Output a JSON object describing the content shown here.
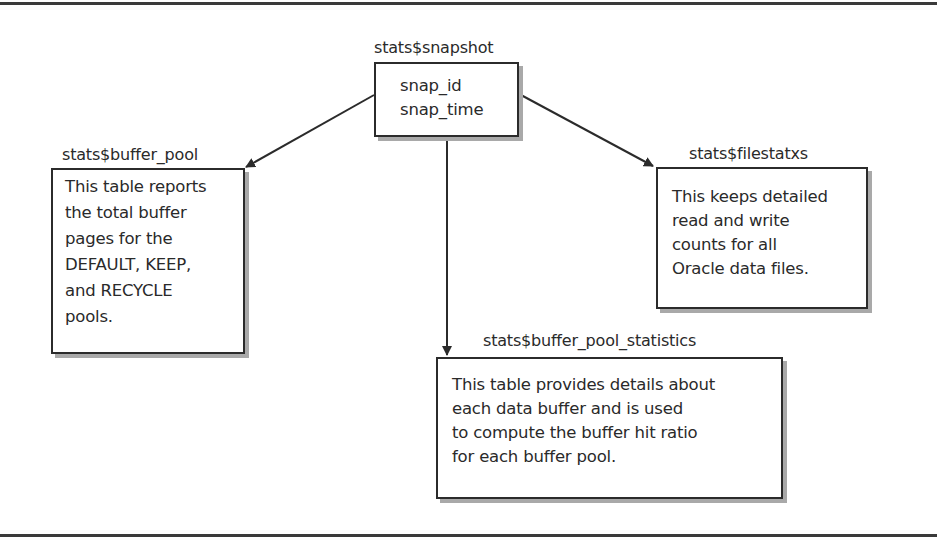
{
  "diagram": {
    "type": "entity-relationship",
    "frame": {
      "top_rule": true,
      "bottom_rule": true
    },
    "nodes": {
      "snapshot": {
        "title": "stats$snapshot",
        "lines": [
          "snap_id",
          "snap_time"
        ]
      },
      "buffer_pool": {
        "title": "stats$buffer_pool",
        "lines": [
          "This table reports",
          "the total buffer",
          "pages for the",
          "DEFAULT, KEEP,",
          "and RECYCLE",
          "pools."
        ]
      },
      "filestatxs": {
        "title": "stats$filestatxs",
        "lines": [
          "This keeps detailed",
          "read and write",
          "counts for all",
          "Oracle data files."
        ]
      },
      "buffer_pool_statistics": {
        "title": "stats$buffer_pool_statistics",
        "lines": [
          "This table provides details about",
          "each data buffer and is used",
          "to compute the buffer hit ratio",
          "for each buffer pool."
        ]
      }
    },
    "edges": [
      {
        "from": "stats$snapshot",
        "to": "stats$buffer_pool"
      },
      {
        "from": "stats$snapshot",
        "to": "stats$filestatxs"
      },
      {
        "from": "stats$snapshot",
        "to": "stats$buffer_pool_statistics"
      }
    ],
    "colors": {
      "line": "#2b2b2b",
      "shadow": "#a9a9a9",
      "text": "#2a2a2a",
      "background": "#ffffff"
    }
  }
}
